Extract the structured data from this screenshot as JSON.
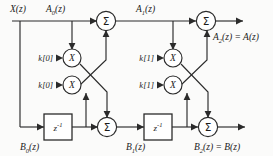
{
  "figure": {
    "name": "lattice-filter-signal-flow-graph",
    "stage_count": 2,
    "colors": {
      "line": "#2b2b2b",
      "text": "#1c1c1c",
      "node_fill": "#ffffff",
      "background": "#fbfbfa"
    }
  },
  "labels": {
    "input": {
      "base": "X",
      "arg": "(z)"
    },
    "a0": {
      "base": "A",
      "sub": "0",
      "arg": "(z)"
    },
    "a1": {
      "base": "A",
      "sub": "1",
      "arg": "(z)"
    },
    "a2": {
      "base": "A",
      "sub": "2",
      "arg": "(z) = A(z)"
    },
    "b0": {
      "base": "B",
      "sub": "0",
      "arg": "(z)"
    },
    "b1": {
      "base": "B",
      "sub": "1",
      "arg": "(z)"
    },
    "b2": {
      "base": "B",
      "sub": "2",
      "arg": "(z) = B(z)"
    }
  },
  "coefficients": [
    {
      "id": "k0-upper",
      "text": "k[0]"
    },
    {
      "id": "k0-lower",
      "text": "k[0]"
    },
    {
      "id": "k1-upper",
      "text": "k[1]"
    },
    {
      "id": "k1-lower",
      "text": "k[1]"
    }
  ],
  "nodes": {
    "summers": [
      {
        "id": "sum-a1",
        "glyph": "Σ"
      },
      {
        "id": "sum-a2",
        "glyph": "Σ"
      },
      {
        "id": "sum-b1",
        "glyph": "Σ"
      },
      {
        "id": "sum-b2",
        "glyph": "Σ"
      }
    ],
    "multipliers": [
      {
        "id": "mult-k0-upper",
        "glyph": "X"
      },
      {
        "id": "mult-k0-lower",
        "glyph": "X"
      },
      {
        "id": "mult-k1-upper",
        "glyph": "X"
      },
      {
        "id": "mult-k1-lower",
        "glyph": "X"
      }
    ],
    "delays": [
      {
        "id": "delay-stage-1",
        "base": "z",
        "exp": "-1"
      },
      {
        "id": "delay-stage-2",
        "base": "z",
        "exp": "-1"
      }
    ]
  }
}
